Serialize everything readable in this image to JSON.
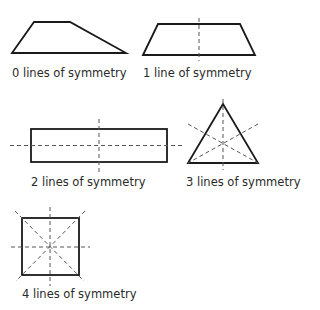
{
  "figure": {
    "title": "Lines of symmetry",
    "items": [
      {
        "shape": "irregular quadrilateral",
        "lines": 0,
        "label": "0 lines of symmetry"
      },
      {
        "shape": "isosceles trapezoid",
        "lines": 1,
        "label": "1 line of symmetry"
      },
      {
        "shape": "rectangle",
        "lines": 2,
        "label": "2 lines of symmetry"
      },
      {
        "shape": "equilateral triangle",
        "lines": 3,
        "label": "3 lines of symmetry"
      },
      {
        "shape": "square",
        "lines": 4,
        "label": "4 lines of symmetry"
      }
    ],
    "colors": {
      "outline": "#1a1a1a",
      "symmetry_line": "#555555",
      "text": "#2a2a2a"
    }
  }
}
